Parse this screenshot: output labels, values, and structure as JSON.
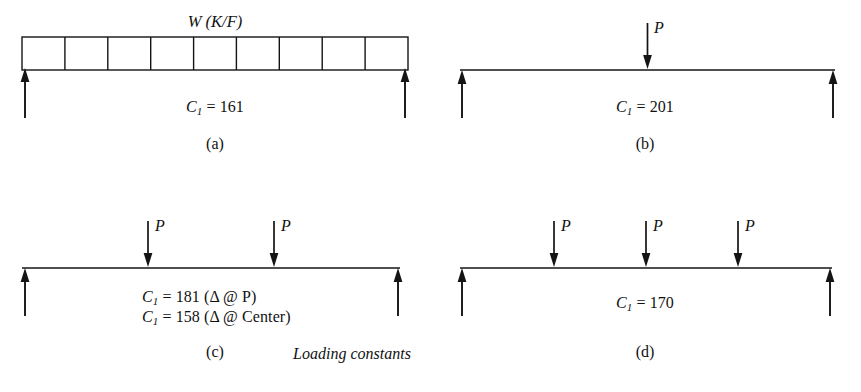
{
  "figure": {
    "caption": "Loading constants",
    "caption_x": 352,
    "caption_y": 345
  },
  "panels": [
    {
      "key": "a",
      "letter": "(a)",
      "load_type": "uniformly-distributed-load",
      "load_label": "W (K/F)",
      "load_cells": 9,
      "point_loads": [],
      "constants": [
        {
          "symbol": "C",
          "sub": "1",
          "eq": "=",
          "value": "161",
          "note": ""
        }
      ]
    },
    {
      "key": "b",
      "letter": "(b)",
      "load_type": "single-point-load",
      "load_label": "",
      "load_cells": 0,
      "point_loads": [
        {
          "label": "P",
          "position_fraction": 0.5
        }
      ],
      "constants": [
        {
          "symbol": "C",
          "sub": "1",
          "eq": "=",
          "value": "201",
          "note": ""
        }
      ]
    },
    {
      "key": "c",
      "letter": "(c)",
      "load_type": "two-point-loads",
      "load_label": "",
      "load_cells": 0,
      "point_loads": [
        {
          "label": "P",
          "position_fraction": 0.3333
        },
        {
          "label": "P",
          "position_fraction": 0.6667
        }
      ],
      "constants": [
        {
          "symbol": "C",
          "sub": "1",
          "eq": "=",
          "value": "181",
          "note": "(Δ @ P)"
        },
        {
          "symbol": "C",
          "sub": "1",
          "eq": "=",
          "value": "158",
          "note": "(Δ @ Center)"
        }
      ]
    },
    {
      "key": "d",
      "letter": "(d)",
      "load_type": "three-point-loads",
      "load_label": "",
      "load_cells": 0,
      "point_loads": [
        {
          "label": "P",
          "position_fraction": 0.25
        },
        {
          "label": "P",
          "position_fraction": 0.5
        },
        {
          "label": "P",
          "position_fraction": 0.75
        }
      ],
      "constants": [
        {
          "symbol": "C",
          "sub": "1",
          "eq": "=",
          "value": "170",
          "note": ""
        }
      ]
    }
  ],
  "notation": {
    "delta": "Δ",
    "at": "@",
    "reaction_arrow": "upward-reaction-arrow",
    "load_arrow": "downward-load-arrow"
  },
  "colors": {
    "ink": "#111111",
    "background": "#ffffff"
  }
}
